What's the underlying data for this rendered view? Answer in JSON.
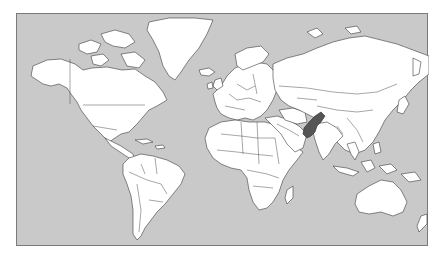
{
  "map": {
    "type": "world-political-outline",
    "projection": "Mercator",
    "highlighted_country": "Pakistan",
    "colors": {
      "ocean": "#c9c9c9",
      "land": "#ffffff",
      "borders": "#3a3a3a",
      "highlight": "#555555",
      "frame": "#7a7a7a"
    }
  }
}
